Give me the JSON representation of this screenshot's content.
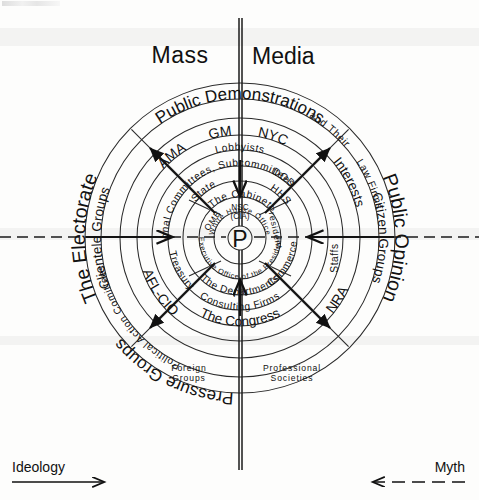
{
  "meta": {
    "center_symbol": "P",
    "width": 479,
    "height": 500,
    "ink_color": "#111111",
    "paper_color": "#fdfdfc"
  },
  "axes": {
    "vertical_label_top": "Mass Media",
    "horizontal_left_label": "The Electorate",
    "horizontal_right_label": "Public Opinion"
  },
  "footer": {
    "left_label": "Ideology",
    "left_arrow_direction": "right",
    "left_arrow_style": "solid",
    "right_label": "Myth",
    "right_arrow_direction": "left",
    "right_arrow_style": "dashed"
  },
  "rings": [
    {
      "index": 1,
      "name": "outermost-environment",
      "radius": 155,
      "labels": [
        "The Electorate",
        "Public Opinion"
      ]
    },
    {
      "index": 2,
      "name": "mass-publics",
      "radius": 139,
      "labels": [
        "Public Demonstrations",
        "Pressure Groups",
        "Citizen Groups"
      ]
    },
    {
      "index": 3,
      "name": "organized-groups",
      "radius": 120,
      "labels": [
        "Clientele Groups",
        "Interests",
        "Consulting Firms"
      ]
    },
    {
      "index": 4,
      "name": "named-group-examples",
      "radius": 103,
      "labels": [
        "AMA",
        "GM",
        "NYC",
        "AFL-CIO",
        "NRA",
        "Foreign Groups",
        "Professional Societies"
      ]
    },
    {
      "index": 5,
      "name": "intermediaries",
      "radius": 88,
      "labels": [
        "Lobbyists",
        "Political Action Comittees",
        "Law Firms",
        "The Congress"
      ]
    },
    {
      "index": 6,
      "name": "congressional-layer",
      "radius": 72,
      "labels": [
        "Congressional Committees, Subcommittees",
        "and Their",
        "Staffs"
      ]
    },
    {
      "index": 7,
      "name": "departments",
      "radius": 57,
      "labels": [
        "State",
        "DOD",
        "HHS",
        "Commerce",
        "Treasury",
        "The Departments"
      ]
    },
    {
      "index": 8,
      "name": "cabinet-and-eop",
      "radius": 41,
      "labels": [
        "The Cabinet",
        "Executive Office of the President",
        "OMB",
        "NSC (CIA)"
      ]
    },
    {
      "index": 9,
      "name": "white-house-office",
      "radius": 26,
      "labels": [
        "White House Office"
      ]
    },
    {
      "index": 10,
      "name": "president-core",
      "radius": 12,
      "labels": [
        "P"
      ]
    }
  ],
  "labels": {
    "mass_media": "Mass Media",
    "public_demonstrations": "Public Demonstrations",
    "the_electorate": "The Electorate",
    "public_opinion": "Public Opinion",
    "pressure_groups": "Pressure Groups",
    "citizen_groups": "Citizen Groups",
    "clientele_groups": "Clientele Groups",
    "interests": "Interests",
    "ama": "AMA",
    "gm": "GM",
    "nyc": "NYC",
    "afl_cio": "AFL-CIO",
    "nra": "NRA",
    "lobbyists": "Lobbyists",
    "political_action_comittees": "Political Action Comittees",
    "law_firms": "Law Firms",
    "congressional_committees": "Congressional Committees, Subcommittees",
    "and_their": "and Their",
    "staffs": "Staffs",
    "state": "State",
    "dod": "DOD",
    "hhs": "HHS",
    "commerce": "Commerce",
    "treasury": "Treasury",
    "the_departments": "The Departments",
    "the_cabinet": "The Cabinet",
    "executive_office": "Executive Office of the President",
    "omb": "OMB",
    "nsc": "NSC",
    "cia": "(CIA)",
    "white_house_office": "White House Office",
    "president": "P",
    "the_congress": "The Congress",
    "consulting_firms": "Consulting Firms",
    "foreign_groups_1": "Foreign",
    "foreign_groups_2": "Groups",
    "professional_societies_1": "Professional",
    "professional_societies_2": "Societies"
  },
  "arrows": {
    "inward_cardinal": [
      "top",
      "bottom",
      "left",
      "right"
    ],
    "outward_diagonal": [
      "top-left",
      "top-right",
      "bottom-left",
      "bottom-right"
    ]
  }
}
